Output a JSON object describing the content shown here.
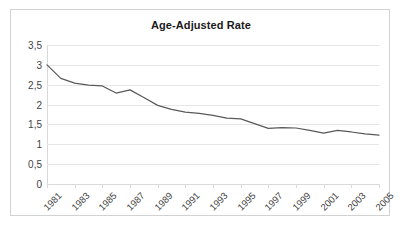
{
  "chart": {
    "title": "Age-Adjusted Rate",
    "decimal_separator": ","
  },
  "chart_data": {
    "type": "line",
    "title": "Age-Adjusted Rate",
    "xlabel": "",
    "ylabel": "",
    "x": [
      1981,
      1982,
      1983,
      1984,
      1985,
      1986,
      1987,
      1988,
      1989,
      1990,
      1991,
      1992,
      1993,
      1994,
      1995,
      1996,
      1997,
      1998,
      1999,
      2000,
      2001,
      2002,
      2003,
      2004,
      2005
    ],
    "values": [
      3.0,
      2.66,
      2.54,
      2.49,
      2.47,
      2.29,
      2.37,
      2.18,
      1.98,
      1.88,
      1.81,
      1.78,
      1.73,
      1.66,
      1.64,
      1.52,
      1.4,
      1.42,
      1.41,
      1.35,
      1.28,
      1.35,
      1.31,
      1.26,
      1.23
    ],
    "series": [
      {
        "name": "Age-Adjusted Rate",
        "color": "#595959",
        "values": [
          3.0,
          2.66,
          2.54,
          2.49,
          2.47,
          2.29,
          2.37,
          2.18,
          1.98,
          1.88,
          1.81,
          1.78,
          1.73,
          1.66,
          1.64,
          1.52,
          1.4,
          1.42,
          1.41,
          1.35,
          1.28,
          1.35,
          1.31,
          1.26,
          1.23
        ]
      }
    ],
    "xlim": [
      1981,
      2005
    ],
    "ylim": [
      0,
      3.5
    ],
    "yticks": [
      0,
      0.5,
      1,
      1.5,
      2,
      2.5,
      3,
      3.5
    ],
    "ytick_labels": [
      "0",
      "0,5",
      "1",
      "1,5",
      "2",
      "2,5",
      "3",
      "3,5"
    ],
    "xtick_values": [
      1981,
      1983,
      1985,
      1987,
      1989,
      1991,
      1993,
      1995,
      1997,
      1999,
      2001,
      2003,
      2005
    ],
    "xtick_labels": [
      "1981",
      "1983",
      "1985",
      "1987",
      "1989",
      "1991",
      "1993",
      "1995",
      "1997",
      "1999",
      "2001",
      "2003",
      "2005"
    ],
    "xtick_rotation": -45,
    "grid": true,
    "grid_axis": "y",
    "legend": false,
    "markers": false,
    "line_color": "#595959",
    "line_width": 1.2,
    "grid_color": "#e6e6e6",
    "axis_color": "#d9d9d9",
    "frame_color": "#d2d2d2",
    "background": "#ffffff"
  }
}
